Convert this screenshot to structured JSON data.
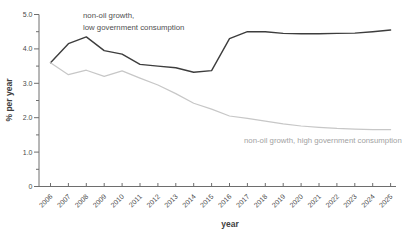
{
  "chart_data": {
    "type": "line",
    "title": "",
    "xlabel": "year",
    "ylabel": "% per year",
    "ylim": [
      0,
      5.0
    ],
    "ytick_values": [
      0,
      1.0,
      2.0,
      3.0,
      4.0,
      5.0
    ],
    "ytick_labels": [
      "0",
      "1.0",
      "2.0",
      "3.0",
      "4.0",
      "5.0"
    ],
    "minor_ytick_values": [
      0.5,
      1.5,
      2.5,
      3.5,
      4.5
    ],
    "grid": false,
    "legend_position": "inline-annotations",
    "categories": [
      "2006",
      "2007",
      "2008",
      "2009",
      "2010",
      "2011",
      "2012",
      "2013",
      "2014",
      "2015",
      "2016",
      "2017",
      "2018",
      "2019",
      "2020",
      "2021",
      "2022",
      "2023",
      "2024",
      "2025"
    ],
    "series": [
      {
        "name": "non-oil growth, low government consumption",
        "color": "#3d3d3d",
        "stroke_width": 1.4,
        "values": [
          3.6,
          4.15,
          4.35,
          3.95,
          3.85,
          3.55,
          3.5,
          3.45,
          3.32,
          3.37,
          4.3,
          4.5,
          4.5,
          4.45,
          4.44,
          4.44,
          4.45,
          4.46,
          4.5,
          4.55
        ]
      },
      {
        "name": "non-oil growth, high government consumption",
        "color": "#c7c7c7",
        "stroke_width": 1.2,
        "values": [
          3.6,
          3.25,
          3.38,
          3.2,
          3.36,
          3.15,
          2.95,
          2.7,
          2.42,
          2.25,
          2.05,
          1.98,
          1.9,
          1.82,
          1.76,
          1.72,
          1.69,
          1.67,
          1.65,
          1.65
        ]
      }
    ],
    "annotations": [
      {
        "lines": [
          "non-oil growth,",
          "low government consumption"
        ],
        "color": "#4f4f4f",
        "x": 83,
        "y": 18,
        "line_height": 12
      },
      {
        "lines": [
          "non-oil growth, high government consumption"
        ],
        "color": "#a2a2a2",
        "x": 244,
        "y": 143,
        "line_height": 12
      }
    ],
    "axis_color": "#6e6e6e",
    "plot_area": {
      "x_left": 39,
      "x_right": 396,
      "y_top": 14.5,
      "y_bottom": 186.5,
      "x_first_point": 50.5,
      "x_point_step": 17.9
    }
  }
}
